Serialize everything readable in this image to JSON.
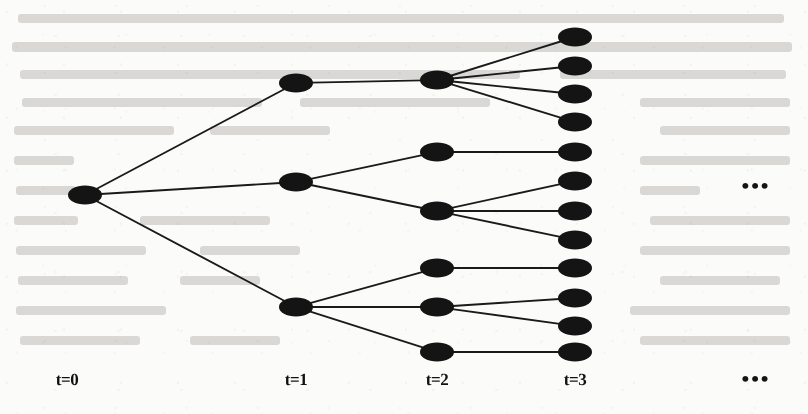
{
  "figure": {
    "kind": "scenario-event-tree",
    "background_color": "#fbfbf9",
    "node_color": "#141414",
    "edge_color": "#1a1a1a",
    "label_color": "#111111"
  },
  "stage_labels": [
    {
      "id": "t0",
      "text": "t=0",
      "x": 67,
      "y": 381
    },
    {
      "id": "t1",
      "text": "t=1",
      "x": 296,
      "y": 381
    },
    {
      "id": "t2",
      "text": "t=2",
      "x": 437,
      "y": 381
    },
    {
      "id": "t3",
      "text": "t=3",
      "x": 575,
      "y": 381
    }
  ],
  "ellipses": [
    {
      "id": "continuation-right",
      "text": "•••",
      "x": 756,
      "y": 186
    },
    {
      "id": "continuation-bottom",
      "text": "•••",
      "x": 756,
      "y": 379
    }
  ],
  "geometry": {
    "node_rx": 17,
    "node_ry": 9.5,
    "edge_width": 1.9
  },
  "nodes": [
    {
      "id": "n0",
      "stage": 0,
      "x": 85,
      "y": 195
    },
    {
      "id": "n1-0",
      "stage": 1,
      "x": 296,
      "y": 83
    },
    {
      "id": "n1-1",
      "stage": 1,
      "x": 296,
      "y": 182
    },
    {
      "id": "n1-2",
      "stage": 1,
      "x": 296,
      "y": 307
    },
    {
      "id": "n2-0",
      "stage": 2,
      "x": 437,
      "y": 80
    },
    {
      "id": "n2-1",
      "stage": 2,
      "x": 437,
      "y": 152
    },
    {
      "id": "n2-2",
      "stage": 2,
      "x": 437,
      "y": 211
    },
    {
      "id": "n2-3",
      "stage": 2,
      "x": 437,
      "y": 268
    },
    {
      "id": "n2-4",
      "stage": 2,
      "x": 437,
      "y": 307
    },
    {
      "id": "n2-5",
      "stage": 2,
      "x": 437,
      "y": 352
    },
    {
      "id": "n3-0",
      "stage": 3,
      "x": 575,
      "y": 37
    },
    {
      "id": "n3-1",
      "stage": 3,
      "x": 575,
      "y": 66
    },
    {
      "id": "n3-2",
      "stage": 3,
      "x": 575,
      "y": 94
    },
    {
      "id": "n3-3",
      "stage": 3,
      "x": 575,
      "y": 122
    },
    {
      "id": "n3-4",
      "stage": 3,
      "x": 575,
      "y": 152
    },
    {
      "id": "n3-5",
      "stage": 3,
      "x": 575,
      "y": 181
    },
    {
      "id": "n3-6",
      "stage": 3,
      "x": 575,
      "y": 211
    },
    {
      "id": "n3-7",
      "stage": 3,
      "x": 575,
      "y": 240
    },
    {
      "id": "n3-8",
      "stage": 3,
      "x": 575,
      "y": 268
    },
    {
      "id": "n3-9",
      "stage": 3,
      "x": 575,
      "y": 298
    },
    {
      "id": "n3-10",
      "stage": 3,
      "x": 575,
      "y": 326
    },
    {
      "id": "n3-11",
      "stage": 3,
      "x": 575,
      "y": 352
    }
  ],
  "edges": [
    {
      "from": "n0",
      "to": "n1-0"
    },
    {
      "from": "n0",
      "to": "n1-1"
    },
    {
      "from": "n0",
      "to": "n1-2"
    },
    {
      "from": "n1-0",
      "to": "n2-0"
    },
    {
      "from": "n1-1",
      "to": "n2-1"
    },
    {
      "from": "n1-1",
      "to": "n2-2"
    },
    {
      "from": "n1-2",
      "to": "n2-3"
    },
    {
      "from": "n1-2",
      "to": "n2-4"
    },
    {
      "from": "n1-2",
      "to": "n2-5"
    },
    {
      "from": "n2-0",
      "to": "n3-0"
    },
    {
      "from": "n2-0",
      "to": "n3-1"
    },
    {
      "from": "n2-0",
      "to": "n3-2"
    },
    {
      "from": "n2-0",
      "to": "n3-3"
    },
    {
      "from": "n2-1",
      "to": "n3-4"
    },
    {
      "from": "n2-2",
      "to": "n3-5"
    },
    {
      "from": "n2-2",
      "to": "n3-6"
    },
    {
      "from": "n2-2",
      "to": "n3-7"
    },
    {
      "from": "n2-3",
      "to": "n3-8"
    },
    {
      "from": "n2-4",
      "to": "n3-9"
    },
    {
      "from": "n2-4",
      "to": "n3-10"
    },
    {
      "from": "n2-5",
      "to": "n3-11"
    }
  ],
  "chart_data": {
    "type": "diagram",
    "title": "",
    "stages": [
      "t=0",
      "t=1",
      "t=2",
      "t=3"
    ],
    "node_counts": [
      1,
      3,
      6,
      12
    ],
    "branching": {
      "t0_to_t1": [
        3
      ],
      "t1_to_t2": [
        1,
        2,
        3
      ],
      "t2_to_t3": [
        4,
        1,
        3,
        1,
        2,
        1
      ]
    }
  },
  "ghost_text_lines": [
    {
      "x": 18,
      "y": 14,
      "width": 766,
      "height": 9
    },
    {
      "x": 12,
      "y": 42,
      "width": 780,
      "height": 10
    },
    {
      "x": 20,
      "y": 70,
      "width": 500,
      "height": 9
    },
    {
      "x": 560,
      "y": 70,
      "width": 226,
      "height": 9
    },
    {
      "x": 22,
      "y": 98,
      "width": 240,
      "height": 9
    },
    {
      "x": 300,
      "y": 98,
      "width": 190,
      "height": 9
    },
    {
      "x": 640,
      "y": 98,
      "width": 150,
      "height": 9
    },
    {
      "x": 14,
      "y": 126,
      "width": 160,
      "height": 9
    },
    {
      "x": 210,
      "y": 126,
      "width": 120,
      "height": 9
    },
    {
      "x": 660,
      "y": 126,
      "width": 130,
      "height": 9
    },
    {
      "x": 14,
      "y": 156,
      "width": 60,
      "height": 9
    },
    {
      "x": 640,
      "y": 156,
      "width": 150,
      "height": 9
    },
    {
      "x": 16,
      "y": 186,
      "width": 60,
      "height": 9
    },
    {
      "x": 640,
      "y": 186,
      "width": 60,
      "height": 9
    },
    {
      "x": 14,
      "y": 216,
      "width": 64,
      "height": 9
    },
    {
      "x": 140,
      "y": 216,
      "width": 130,
      "height": 9
    },
    {
      "x": 650,
      "y": 216,
      "width": 140,
      "height": 9
    },
    {
      "x": 16,
      "y": 246,
      "width": 130,
      "height": 9
    },
    {
      "x": 200,
      "y": 246,
      "width": 100,
      "height": 9
    },
    {
      "x": 640,
      "y": 246,
      "width": 150,
      "height": 9
    },
    {
      "x": 18,
      "y": 276,
      "width": 110,
      "height": 9
    },
    {
      "x": 180,
      "y": 276,
      "width": 80,
      "height": 9
    },
    {
      "x": 660,
      "y": 276,
      "width": 120,
      "height": 9
    },
    {
      "x": 16,
      "y": 306,
      "width": 150,
      "height": 9
    },
    {
      "x": 630,
      "y": 306,
      "width": 160,
      "height": 9
    },
    {
      "x": 20,
      "y": 336,
      "width": 120,
      "height": 9
    },
    {
      "x": 190,
      "y": 336,
      "width": 90,
      "height": 9
    },
    {
      "x": 640,
      "y": 336,
      "width": 150,
      "height": 9
    }
  ]
}
